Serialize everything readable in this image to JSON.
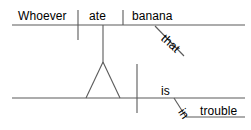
{
  "diagram": {
    "type": "reed-kellogg-sentence-diagram",
    "sentence": "Whoever ate that banana is in trouble",
    "stroke_color": "#5a5a5a",
    "text_color": "#000000",
    "background_color": "#ffffff",
    "words": {
      "subject_clause_subject": "Whoever",
      "subject_clause_verb": "ate",
      "subject_clause_object": "banana",
      "subject_clause_modifier": "that",
      "main_verb": "is",
      "preposition": "in",
      "prepositional_object": "trouble"
    },
    "labels": [
      {
        "text": "Whoever",
        "x": 18,
        "y": 10,
        "role": "clause-subject"
      },
      {
        "text": "ate",
        "x": 89,
        "y": 10,
        "role": "clause-verb"
      },
      {
        "text": "banana",
        "x": 132,
        "y": 10,
        "role": "clause-direct-object"
      },
      {
        "text": "that",
        "x": 159,
        "y": 29,
        "role": "determiner-modifier"
      },
      {
        "text": "is",
        "x": 161,
        "y": 85,
        "role": "main-verb"
      },
      {
        "text": "in",
        "x": 176,
        "y": 101,
        "role": "preposition"
      },
      {
        "text": "trouble",
        "x": 200,
        "y": 105,
        "role": "object-of-preposition"
      }
    ],
    "lines": {
      "upper_baseline": {
        "x1": 12,
        "y1": 25,
        "x2": 245,
        "y2": 25
      },
      "subject_verb_divider": {
        "x1": 78,
        "y1": 10,
        "x2": 78,
        "y2": 40
      },
      "verb_object_divider": {
        "x1": 123,
        "y1": 10,
        "x2": 123,
        "y2": 25
      },
      "that_modifier_slant": {
        "x1": 155,
        "y1": 26,
        "x2": 184,
        "y2": 56
      },
      "clause_stem": {
        "x1": 103,
        "y1": 25,
        "x2": 103,
        "y2": 62
      },
      "pedestal_left": {
        "x1": 103,
        "y1": 62,
        "x2": 86,
        "y2": 98
      },
      "pedestal_right": {
        "x1": 103,
        "y1": 62,
        "x2": 120,
        "y2": 98
      },
      "lower_baseline": {
        "x1": 12,
        "y1": 98,
        "x2": 245,
        "y2": 98
      },
      "subject_predicate_divider": {
        "x1": 137,
        "y1": 64,
        "x2": 137,
        "y2": 113
      },
      "preposition_slant": {
        "x1": 174,
        "y1": 98,
        "x2": 186,
        "y2": 117
      },
      "prep_object_line": {
        "x1": 186,
        "y1": 117,
        "x2": 245,
        "y2": 117
      }
    }
  }
}
